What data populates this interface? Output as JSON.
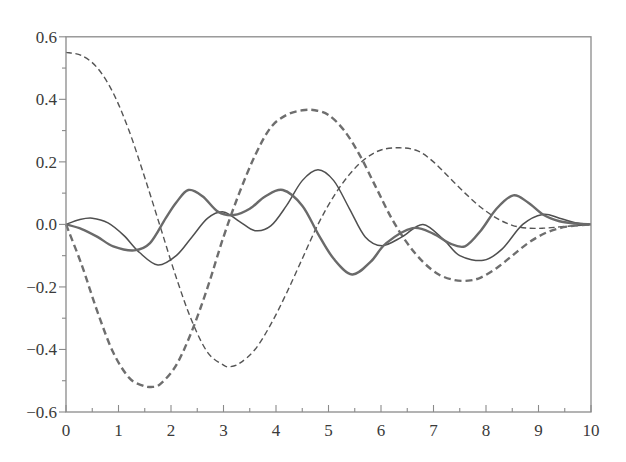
{
  "chart_data": {
    "type": "line",
    "title": "",
    "xlabel": "",
    "ylabel": "",
    "xlim": [
      0,
      10
    ],
    "ylim": [
      -0.6,
      0.6
    ],
    "grid": false,
    "legend": null,
    "x_ticks": [
      0,
      1,
      2,
      3,
      4,
      5,
      6,
      7,
      8,
      9,
      10
    ],
    "x_tick_labels": [
      "0",
      "1",
      "2",
      "3",
      "4",
      "5",
      "6",
      "7",
      "8",
      "9",
      "10"
    ],
    "x_minor_step": 0.5,
    "y_ticks": [
      0.6,
      0.4,
      0.2,
      0.0,
      -0.2,
      -0.4,
      -0.6
    ],
    "y_tick_labels": [
      "0.6",
      "0.4",
      "0.2",
      "0.0",
      "−0.2",
      "−0.4",
      "−0.6"
    ],
    "y_minor_step": 0.1,
    "series": [
      {
        "name": "thin-dashed",
        "style": "dashed",
        "width": 1.4,
        "color": "#555555",
        "x": [
          0,
          0.3,
          0.6,
          0.9,
          1.2,
          1.5,
          1.8,
          2.1,
          2.4,
          2.7,
          3.0,
          3.12,
          3.3,
          3.6,
          3.9,
          4.2,
          4.5,
          4.8,
          5.1,
          5.4,
          5.7,
          6.0,
          6.36,
          6.7,
          7.0,
          7.3,
          7.6,
          7.9,
          8.2,
          8.5,
          8.8,
          9.1,
          9.4,
          9.7,
          10.0
        ],
        "values": [
          0.55,
          0.54,
          0.5,
          0.42,
          0.3,
          0.15,
          -0.01,
          -0.17,
          -0.31,
          -0.41,
          -0.45,
          -0.455,
          -0.445,
          -0.4,
          -0.32,
          -0.22,
          -0.11,
          0.0,
          0.09,
          0.16,
          0.21,
          0.238,
          0.245,
          0.235,
          0.2,
          0.15,
          0.1,
          0.055,
          0.02,
          -0.003,
          -0.012,
          -0.012,
          -0.008,
          -0.004,
          0.0
        ]
      },
      {
        "name": "thick-dashed",
        "style": "dashed",
        "width": 2.4,
        "color": "#6e6e6e",
        "x": [
          0,
          0.3,
          0.6,
          0.9,
          1.2,
          1.45,
          1.62,
          1.8,
          2.1,
          2.4,
          2.7,
          3.0,
          3.3,
          3.6,
          3.9,
          4.2,
          4.5,
          4.74,
          5.0,
          5.3,
          5.6,
          5.9,
          6.2,
          6.5,
          6.8,
          7.1,
          7.4,
          7.66,
          7.9,
          8.2,
          8.5,
          8.8,
          9.1,
          9.4,
          9.7,
          10.0
        ],
        "values": [
          0.0,
          -0.13,
          -0.28,
          -0.41,
          -0.49,
          -0.515,
          -0.52,
          -0.51,
          -0.45,
          -0.34,
          -0.2,
          -0.04,
          0.1,
          0.22,
          0.31,
          0.35,
          0.365,
          0.365,
          0.35,
          0.3,
          0.22,
          0.12,
          0.02,
          -0.06,
          -0.12,
          -0.16,
          -0.178,
          -0.18,
          -0.17,
          -0.14,
          -0.1,
          -0.06,
          -0.03,
          -0.012,
          -0.004,
          0.0
        ]
      },
      {
        "name": "thin-solid",
        "style": "solid",
        "width": 1.5,
        "color": "#4f4f4f",
        "x": [
          0,
          0.25,
          0.5,
          0.8,
          1.1,
          1.4,
          1.75,
          2.1,
          2.4,
          2.7,
          3.0,
          3.3,
          3.6,
          3.9,
          4.2,
          4.5,
          4.8,
          5.1,
          5.4,
          5.7,
          6.02,
          6.4,
          6.8,
          7.2,
          7.5,
          7.95,
          8.3,
          8.7,
          9.08,
          9.4,
          9.7,
          10.0
        ],
        "values": [
          0.0,
          0.015,
          0.02,
          0.005,
          -0.035,
          -0.09,
          -0.13,
          -0.1,
          -0.04,
          0.02,
          0.04,
          0.01,
          -0.02,
          -0.005,
          0.06,
          0.14,
          0.175,
          0.14,
          0.05,
          -0.04,
          -0.068,
          -0.04,
          0.0,
          -0.05,
          -0.1,
          -0.115,
          -0.08,
          0.0,
          0.032,
          0.02,
          0.005,
          0.0
        ]
      },
      {
        "name": "thick-solid",
        "style": "solid",
        "width": 2.4,
        "color": "#6a6a6a",
        "x": [
          0,
          0.3,
          0.6,
          0.9,
          1.3,
          1.6,
          1.9,
          2.1,
          2.33,
          2.6,
          2.9,
          3.2,
          3.5,
          3.8,
          4.13,
          4.5,
          4.8,
          5.1,
          5.45,
          5.8,
          6.1,
          6.6,
          7.0,
          7.3,
          7.6,
          7.9,
          8.2,
          8.52,
          8.8,
          9.1,
          9.4,
          9.7,
          10.0
        ],
        "values": [
          0.0,
          -0.015,
          -0.04,
          -0.07,
          -0.083,
          -0.06,
          0.02,
          0.07,
          0.11,
          0.09,
          0.04,
          0.03,
          0.05,
          0.09,
          0.11,
          0.06,
          -0.03,
          -0.11,
          -0.16,
          -0.12,
          -0.06,
          -0.012,
          -0.03,
          -0.06,
          -0.07,
          -0.02,
          0.05,
          0.093,
          0.07,
          0.03,
          0.01,
          0.003,
          0.0
        ]
      }
    ]
  }
}
